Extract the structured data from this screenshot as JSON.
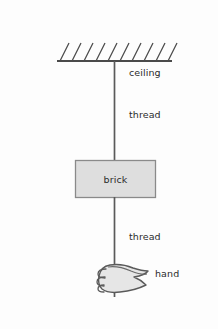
{
  "figure": {
    "width": 218,
    "height": 329,
    "background_color": "#fdfdfd",
    "stroke_color": "#4a4a4a",
    "brick_fill_color": "#dedede",
    "hand_fill_color": "#e2e2e2",
    "text_color": "#2b2b2b"
  },
  "labels": {
    "ceiling": "ceiling",
    "thread_upper": "thread",
    "brick": "brick",
    "thread_lower": "thread",
    "hand": "hand"
  },
  "geometry": {
    "ceiling_line": {
      "x1": 57,
      "y1": 61,
      "x2": 172,
      "y2": 61
    },
    "hatch_count": 10,
    "hatch_start_x": 60,
    "hatch_spacing": 12,
    "hatch_length": 18,
    "hatch_dx": 9,
    "thread_x": 114.5,
    "thread_upper": {
      "y1": 61,
      "y2": 160
    },
    "thread_lower": {
      "y1": 197,
      "y2": 297
    },
    "brick_box": {
      "x": 75,
      "y": 160,
      "width": 81,
      "height": 38
    },
    "hand": {
      "x": 100,
      "y": 264,
      "width": 48,
      "height": 33
    }
  }
}
